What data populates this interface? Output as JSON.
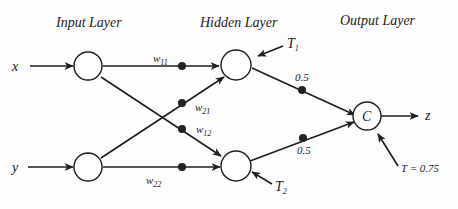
{
  "diagram": {
    "type": "neural-network",
    "layers": {
      "input": "Input Layer",
      "hidden": "Hidden Layer",
      "output": "Output Layer"
    },
    "inputs": [
      "x",
      "y"
    ],
    "output_var": "z",
    "output_node_label": "C",
    "weights": {
      "w11": {
        "base": "w",
        "sub": "11"
      },
      "w21": {
        "base": "w",
        "sub": "21"
      },
      "w12": {
        "base": "w",
        "sub": "12"
      },
      "w22": {
        "base": "w",
        "sub": "22"
      },
      "h1_out": "0.5",
      "h2_out": "0.5"
    },
    "thresholds": {
      "T1": {
        "base": "T",
        "sub": "1"
      },
      "T2": {
        "base": "T",
        "sub": "2"
      },
      "T_out": "T = 0.75"
    }
  }
}
